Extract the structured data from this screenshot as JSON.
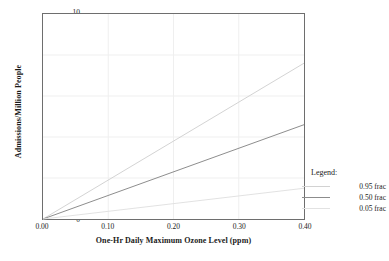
{
  "chart_data": {
    "type": "line",
    "title": "",
    "xlabel": "One-Hr Daily Maximum Ozone Level (ppm)",
    "ylabel": "Admissions/Million People",
    "xlim": [
      0.0,
      0.4
    ],
    "ylim": [
      0,
      10
    ],
    "xticks": [
      "0.00",
      "0.10",
      "0.20",
      "0.30",
      "0.40"
    ],
    "xtick_values": [
      0.0,
      0.1,
      0.2,
      0.3,
      0.4
    ],
    "yticks": [
      "0",
      "2",
      "4",
      "6",
      "8",
      "10"
    ],
    "ytick_values": [
      0,
      2,
      4,
      6,
      8,
      10
    ],
    "grid": true,
    "grid_color": "#efefef",
    "legend_position": "right",
    "x": [
      0.0,
      0.4
    ],
    "series": [
      {
        "name": "0.95 frac",
        "values": [
          0.0,
          7.6
        ],
        "color": "#d2d2d2"
      },
      {
        "name": "0.50 frac",
        "values": [
          0.0,
          4.6
        ],
        "color": "#8c8c8c"
      },
      {
        "name": "0.05 frac",
        "values": [
          0.0,
          1.5
        ],
        "color": "#e2e2e2"
      }
    ]
  },
  "legend": {
    "title": "Legend:",
    "entries": [
      {
        "label": "0.95 frac",
        "color": "#d2d2d2"
      },
      {
        "label": "0.50 frac",
        "color": "#8c8c8c"
      },
      {
        "label": "0.05 frac",
        "color": "#e2e2e2"
      }
    ]
  },
  "axes": {
    "frame_color": "#6e6e6e"
  }
}
